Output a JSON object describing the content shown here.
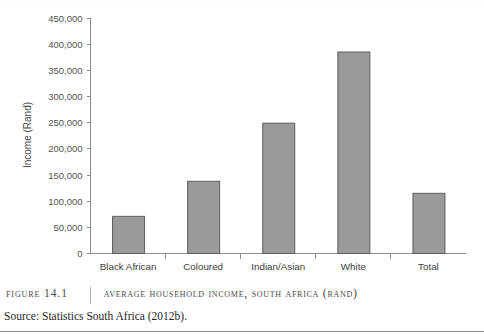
{
  "figure": {
    "number_label": "FIGURE 14.1",
    "title": "Average Household Income, South Africa (Rand)",
    "source": "Source: Statistics South Africa (2012b)."
  },
  "chart_data": {
    "type": "bar",
    "title": "Average Household Income, South Africa (Rand)",
    "categories": [
      "Black African",
      "Coloured",
      "Indian/Asian",
      "White",
      "Total"
    ],
    "values": [
      71000,
      138000,
      249000,
      385000,
      115000
    ],
    "xlabel": "",
    "ylabel": "Income (Rand)",
    "ylim": [
      0,
      450000
    ],
    "ytick_values": [
      0,
      50000,
      100000,
      150000,
      200000,
      250000,
      300000,
      350000,
      400000,
      450000
    ],
    "ytick_labels": [
      "0",
      "50,000",
      "100,000",
      "150,000",
      "200,000",
      "250,000",
      "300,000",
      "350,000",
      "400,000",
      "450,000"
    ],
    "grid": false,
    "legend": false,
    "bar_color": "#9a9a9a",
    "bar_edge_color": "#5e5e5e",
    "axis_color": "#8d8d8d"
  }
}
